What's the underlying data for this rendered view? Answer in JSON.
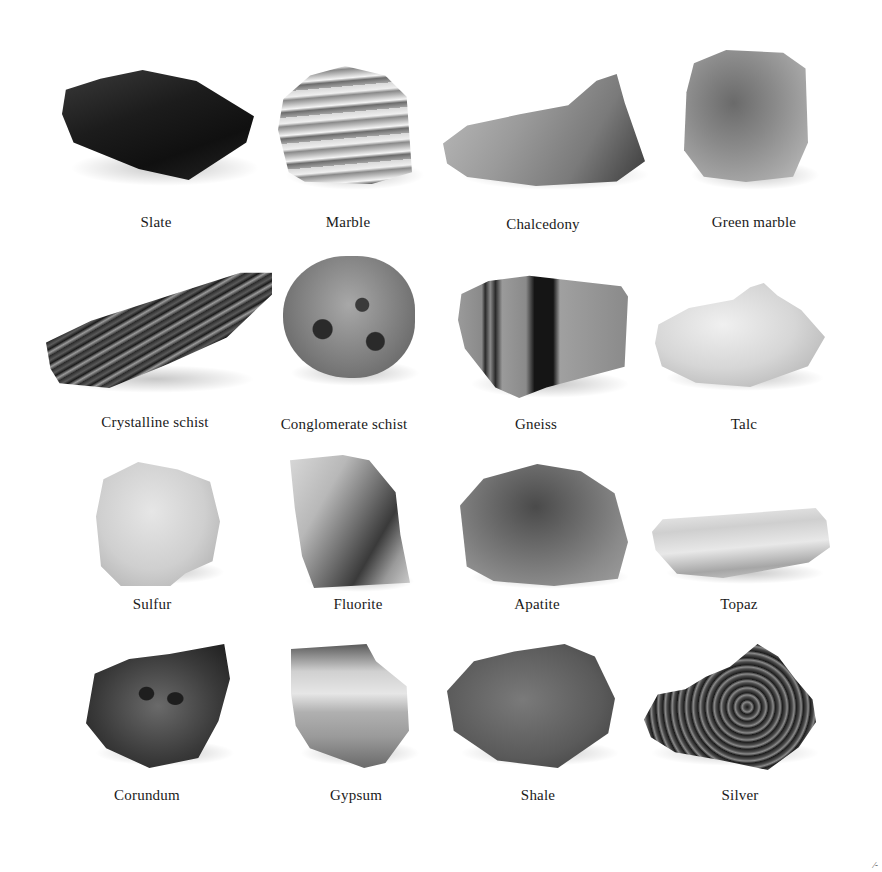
{
  "plate": {
    "colors": {
      "background": "#ffffff",
      "label_text": "#1a1a1a"
    },
    "specimens": [
      {
        "name": "Slate",
        "row": 1,
        "col": 1
      },
      {
        "name": "Marble",
        "row": 1,
        "col": 2
      },
      {
        "name": "Chalcedony",
        "row": 1,
        "col": 3
      },
      {
        "name": "Green marble",
        "row": 1,
        "col": 4
      },
      {
        "name": "Crystalline schist",
        "row": 2,
        "col": 1
      },
      {
        "name": "Conglomerate schist",
        "row": 2,
        "col": 2
      },
      {
        "name": "Gneiss",
        "row": 2,
        "col": 3
      },
      {
        "name": "Talc",
        "row": 2,
        "col": 4
      },
      {
        "name": "Sulfur",
        "row": 3,
        "col": 1
      },
      {
        "name": "Fluorite",
        "row": 3,
        "col": 2
      },
      {
        "name": "Apatite",
        "row": 3,
        "col": 3
      },
      {
        "name": "Topaz",
        "row": 3,
        "col": 4
      },
      {
        "name": "Corundum",
        "row": 4,
        "col": 1
      },
      {
        "name": "Gypsum",
        "row": 4,
        "col": 2
      },
      {
        "name": "Shale",
        "row": 4,
        "col": 3
      },
      {
        "name": "Silver",
        "row": 4,
        "col": 4
      }
    ],
    "corner_mark": "⁄-"
  }
}
